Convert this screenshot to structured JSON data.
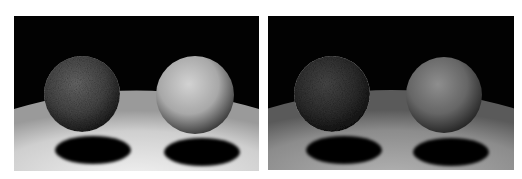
{
  "figure": {
    "panels": [
      {
        "id": "left",
        "x": 14,
        "y": 16,
        "width": 245,
        "height": 155,
        "background": "#020202",
        "floor": {
          "near": "#f2f2f2",
          "far": "#cfcfcf",
          "edge": "#9a9a9a"
        },
        "spheres": [
          {
            "label": "dark-textured-sphere",
            "cx": 68,
            "cy": 78,
            "r": 38,
            "highlight": "#6a6a6a",
            "mid": "#474747",
            "shadow": "#141414"
          },
          {
            "label": "light-matte-sphere",
            "cx": 181,
            "cy": 79,
            "r": 39,
            "highlight": "#d2d2d2",
            "mid": "#a8a8a8",
            "shadow": "#2a2a2a"
          }
        ],
        "shadows": [
          {
            "cx": 79,
            "cy": 134,
            "rx": 38,
            "ry": 14
          },
          {
            "cx": 188,
            "cy": 136,
            "rx": 38,
            "ry": 14
          }
        ]
      },
      {
        "id": "right",
        "x": 268,
        "y": 16,
        "width": 246,
        "height": 154,
        "background": "#020202",
        "floor": {
          "near": "#b4b4b4",
          "far": "#8c8c8c",
          "edge": "#5a5a5a"
        },
        "spheres": [
          {
            "label": "dark-textured-sphere",
            "cx": 64,
            "cy": 78,
            "r": 38,
            "highlight": "#4a4a4a",
            "mid": "#303030",
            "shadow": "#0e0e0e"
          },
          {
            "label": "light-matte-sphere",
            "cx": 176,
            "cy": 79,
            "r": 38,
            "highlight": "#8e8e8e",
            "mid": "#666666",
            "shadow": "#1c1c1c"
          }
        ],
        "shadows": [
          {
            "cx": 76,
            "cy": 134,
            "rx": 38,
            "ry": 14
          },
          {
            "cx": 183,
            "cy": 136,
            "rx": 38,
            "ry": 14
          }
        ]
      }
    ]
  }
}
